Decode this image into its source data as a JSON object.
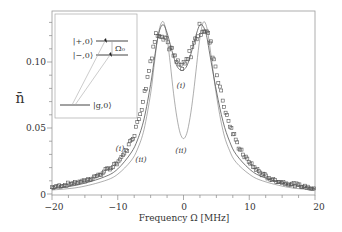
{
  "chart_data": {
    "type": "scatter",
    "title": "",
    "xlabel": "Frequency Ω [MHz]",
    "ylabel": "n̄",
    "xlim": [
      -20,
      20
    ],
    "ylim": [
      0,
      0.14
    ],
    "xticks": [
      -20,
      -10,
      0,
      10,
      20
    ],
    "xtick_labels": [
      "−20",
      "−10",
      "0",
      "10",
      "20"
    ],
    "yticks": [
      0,
      0.05,
      0.1
    ],
    "ytick_labels": [
      "0",
      "0.05",
      "0.10"
    ],
    "grid": false,
    "legend": null,
    "series": [
      {
        "name": "measured data",
        "style": "open squares",
        "x": [
          -20,
          -19,
          -18,
          -17,
          -16,
          -15,
          -14,
          -13,
          -12,
          -11,
          -10,
          -9.5,
          -9,
          -8.5,
          -8,
          -7.5,
          -7,
          -6.5,
          -6,
          -5.5,
          -5,
          -4.5,
          -4,
          -3.5,
          -3,
          -2.5,
          -2,
          -1.5,
          -1,
          -0.5,
          0,
          0.5,
          1,
          1.5,
          2,
          2.5,
          3,
          3.5,
          4,
          4.5,
          5,
          5.5,
          6,
          6.5,
          7,
          7.5,
          8,
          8.5,
          9,
          9.5,
          10,
          11,
          12,
          13,
          14,
          15,
          16,
          17,
          18,
          19,
          20
        ],
        "y": [
          0.005,
          0.006,
          0.007,
          0.008,
          0.009,
          0.01,
          0.012,
          0.014,
          0.017,
          0.02,
          0.024,
          0.027,
          0.031,
          0.035,
          0.04,
          0.046,
          0.054,
          0.063,
          0.075,
          0.088,
          0.102,
          0.114,
          0.122,
          0.124,
          0.121,
          0.116,
          0.11,
          0.104,
          0.099,
          0.096,
          0.096,
          0.1,
          0.106,
          0.113,
          0.12,
          0.125,
          0.126,
          0.123,
          0.116,
          0.106,
          0.094,
          0.082,
          0.071,
          0.061,
          0.053,
          0.046,
          0.04,
          0.035,
          0.031,
          0.027,
          0.024,
          0.019,
          0.015,
          0.012,
          0.01,
          0.009,
          0.008,
          0.007,
          0.006,
          0.005,
          0.004
        ]
      },
      {
        "name": "(i)",
        "style": "solid line",
        "x": [
          -20,
          -16,
          -12,
          -10,
          -8,
          -7,
          -6,
          -5,
          -4.5,
          -4,
          -3.5,
          -3,
          -2.5,
          -2,
          -1.5,
          -1,
          -0.5,
          0,
          0.5,
          1,
          1.5,
          2,
          2.5,
          3,
          3.5,
          4,
          5,
          6,
          7,
          8,
          10,
          12,
          16,
          20
        ],
        "y": [
          0.004,
          0.007,
          0.013,
          0.019,
          0.031,
          0.041,
          0.057,
          0.083,
          0.1,
          0.116,
          0.126,
          0.128,
          0.122,
          0.113,
          0.104,
          0.097,
          0.094,
          0.094,
          0.097,
          0.104,
          0.113,
          0.122,
          0.128,
          0.127,
          0.12,
          0.106,
          0.078,
          0.055,
          0.04,
          0.03,
          0.019,
          0.013,
          0.007,
          0.004
        ]
      },
      {
        "name": "(ii)",
        "style": "solid thin line",
        "x": [
          -20,
          -16,
          -12,
          -10,
          -8,
          -7,
          -6,
          -5,
          -4.5,
          -4,
          -3.5,
          -3,
          -2.5,
          -2,
          -1.5,
          -1,
          -0.5,
          0,
          0.5,
          1,
          1.5,
          2,
          2.5,
          3,
          3.5,
          4,
          5,
          6,
          7,
          8,
          10,
          12,
          16,
          20
        ],
        "y": [
          0.003,
          0.005,
          0.01,
          0.015,
          0.025,
          0.034,
          0.049,
          0.076,
          0.096,
          0.116,
          0.128,
          0.13,
          0.118,
          0.098,
          0.076,
          0.058,
          0.046,
          0.042,
          0.046,
          0.058,
          0.076,
          0.098,
          0.118,
          0.13,
          0.127,
          0.112,
          0.075,
          0.048,
          0.033,
          0.024,
          0.015,
          0.01,
          0.005,
          0.003
        ]
      }
    ],
    "annotations": [
      {
        "text": "(i)",
        "x": -0.6,
        "y": 0.08,
        "target": "curve (i) dip"
      },
      {
        "text": "(ii)",
        "x": -0.6,
        "y": 0.032,
        "target": "curve (ii) dip"
      },
      {
        "text": "(i)",
        "x": -10.5,
        "y": 0.037,
        "target": "curve (i) left flank"
      },
      {
        "text": "(ii)",
        "x": -7.5,
        "y": 0.028,
        "target": "curve (ii) left flank"
      }
    ],
    "inset": {
      "description": "energy level diagram",
      "levels": [
        "|+,0⟩",
        "|−,0⟩",
        "|g,0⟩"
      ],
      "splitting_label": "Ω₀"
    }
  },
  "axes": {
    "xlabel": "Frequency Ω [MHz]",
    "ylabel": "n̄",
    "xtick_labels": [
      "−20",
      "−10",
      "0",
      "10",
      "20"
    ],
    "ytick_labels": [
      "0",
      "0.05",
      "0.10"
    ]
  },
  "inset": {
    "level_plus": "|+,0⟩",
    "level_minus": "|−,0⟩",
    "level_ground": "|g,0⟩",
    "splitting": "Ω₀"
  },
  "annotations": {
    "i_dip": "(i)",
    "ii_dip": "(ii)",
    "i_flank": "(i)",
    "ii_flank": "(ii)"
  },
  "colors": {
    "axis": "#888888",
    "curve": "#555555",
    "marker": "#555555",
    "text": "#333333"
  }
}
